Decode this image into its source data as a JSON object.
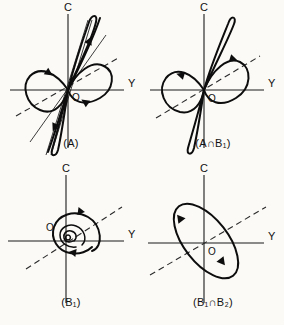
{
  "figure": {
    "background_color": "#fbfaf7",
    "ink_color": "#0d0d0d",
    "panel_count": 4
  },
  "axes": {
    "vertical_label": "C",
    "horizontal_label": "Y",
    "origin_label": "O"
  },
  "panels": [
    {
      "id": "panel-a",
      "caption_prefix": "(A",
      "caption_full": "(A)",
      "caption_sub1": "",
      "caption_mid": "",
      "caption_sub2": "",
      "caption_suffix": ")",
      "description": "figure-eight lemniscate with steep narrow loop and two straight separatrix lines through origin",
      "features": [
        "lemniscate",
        "narrow-steep-loop",
        "straight-lines",
        "dashed-diagonal",
        "flow-arrows"
      ]
    },
    {
      "id": "panel-a-int-b1",
      "caption_prefix": "(A",
      "caption_full": "(A∩B₁)",
      "caption_sub1": "",
      "caption_mid": "∩B",
      "caption_sub2": "1",
      "caption_suffix": ")",
      "description": "figure-eight lemniscate with narrow steep loop, no straight separatrix lines",
      "features": [
        "lemniscate",
        "narrow-steep-loop",
        "dashed-diagonal",
        "flow-arrows"
      ]
    },
    {
      "id": "panel-b1",
      "caption_prefix": "(B",
      "caption_full": "(B₁)",
      "caption_sub1": "1",
      "caption_mid": "",
      "caption_sub2": "",
      "caption_suffix": ")",
      "description": "nested spiral of shrinking closed orbits about the origin",
      "features": [
        "spiral",
        "nested-orbits",
        "dashed-diagonal",
        "flow-arrows"
      ]
    },
    {
      "id": "panel-b1-int-b2",
      "caption_prefix": "(B",
      "caption_full": "(B₁∩B₂)",
      "caption_sub1": "1",
      "caption_mid": "∩B",
      "caption_sub2": "2",
      "caption_suffix": ")",
      "description": "single tilted closed ellipse orbit about the origin",
      "features": [
        "single-ellipse",
        "dashed-diagonal",
        "flow-arrows"
      ]
    }
  ]
}
